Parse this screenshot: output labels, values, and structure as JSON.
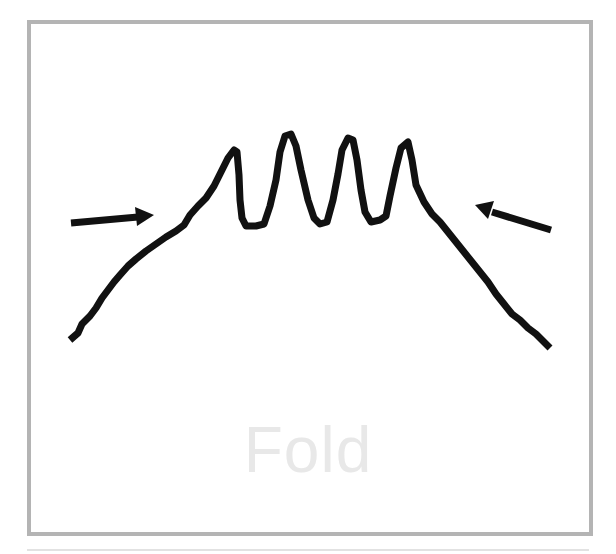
{
  "diagram": {
    "caption": "Fold",
    "colors": {
      "frame_border": "#b4b4b4",
      "stroke": "#111111",
      "caption": "#e8e8e8",
      "background": "#ffffff"
    },
    "elements": [
      {
        "type": "folded-layer",
        "description": "Rock layer with four tight upward folds at center, sloping down on both sides"
      },
      {
        "type": "arrow",
        "direction": "right",
        "description": "Compression arrow from left pointing toward the fold"
      },
      {
        "type": "arrow",
        "direction": "left",
        "description": "Compression arrow from right pointing toward the fold"
      }
    ]
  }
}
